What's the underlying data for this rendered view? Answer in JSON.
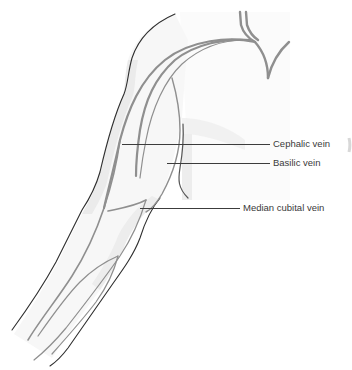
{
  "diagram": {
    "labels": [
      {
        "id": "cephalic",
        "text": "Cephalic vein"
      },
      {
        "id": "basilic",
        "text": "Basilic vein"
      },
      {
        "id": "median_cubital",
        "text": "Median cubital vein"
      }
    ]
  },
  "colors": {
    "outline": "#2e2e2e",
    "vein": "#8f8f8f",
    "shadow": "#e6e6e6",
    "leader": "#3c3c3c",
    "label_text": "#3a3a3a",
    "background": "#ffffff"
  }
}
